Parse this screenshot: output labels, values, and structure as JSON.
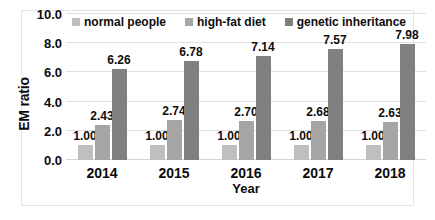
{
  "chart_data": {
    "type": "bar",
    "title": "",
    "xlabel": "Year",
    "ylabel": "EM ratio",
    "categories": [
      "2014",
      "2015",
      "2016",
      "2017",
      "2018"
    ],
    "series": [
      {
        "name": "normal people",
        "color": "#BFBFBF",
        "values": [
          1.0,
          1.0,
          1.0,
          1.0,
          1.0
        ],
        "labels": [
          "1.00",
          "1.00",
          "1.00",
          "1.00",
          "1.00"
        ]
      },
      {
        "name": "high-fat diet",
        "color": "#A5A5A5",
        "values": [
          2.43,
          2.74,
          2.7,
          2.68,
          2.63
        ],
        "labels": [
          "2.43",
          "2.74",
          "2.70",
          "2.68",
          "2.63"
        ]
      },
      {
        "name": "genetic inheritance",
        "color": "#808080",
        "values": [
          6.26,
          6.78,
          7.14,
          7.57,
          7.98
        ],
        "labels": [
          "6.26",
          "6.78",
          "7.14",
          "7.57",
          "7.98"
        ]
      }
    ],
    "ylim": [
      0.0,
      10.0
    ],
    "ytick_step": 2.0,
    "yticks": [
      "10.0",
      "8.0",
      "6.0",
      "4.0",
      "2.0",
      "0.0"
    ],
    "ytick_values": [
      10.0,
      8.0,
      6.0,
      4.0,
      2.0,
      0.0
    ],
    "grid": true,
    "grid_axis": "y",
    "legend_position": "top",
    "data_labels": true
  },
  "legend": {
    "items": [
      {
        "label": "normal people"
      },
      {
        "label": "high-fat diet"
      },
      {
        "label": "genetic inheritance"
      }
    ]
  }
}
